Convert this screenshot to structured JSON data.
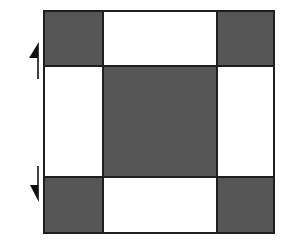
{
  "diagram": {
    "colors": {
      "background": "#ffffff",
      "shaded": "#555555",
      "unshaded": "#ffffff",
      "stroke": "#1e1e1e",
      "arrow": "#111111"
    },
    "grid": {
      "x": [
        44,
        103,
        217,
        274
      ],
      "y": [
        11,
        66,
        177,
        233
      ],
      "cells": [
        {
          "row": 0,
          "col": 0,
          "shaded": true,
          "name": "top-left-corner-square"
        },
        {
          "row": 0,
          "col": 1,
          "shaded": false,
          "name": "top-edge-rectangle"
        },
        {
          "row": 0,
          "col": 2,
          "shaded": true,
          "name": "top-right-corner-square"
        },
        {
          "row": 1,
          "col": 0,
          "shaded": false,
          "name": "left-edge-rectangle"
        },
        {
          "row": 1,
          "col": 1,
          "shaded": true,
          "name": "center-square"
        },
        {
          "row": 1,
          "col": 2,
          "shaded": false,
          "name": "right-edge-rectangle"
        },
        {
          "row": 2,
          "col": 0,
          "shaded": true,
          "name": "bottom-left-corner-square"
        },
        {
          "row": 2,
          "col": 1,
          "shaded": false,
          "name": "bottom-edge-rectangle"
        },
        {
          "row": 2,
          "col": 2,
          "shaded": true,
          "name": "bottom-right-corner-square"
        }
      ]
    },
    "arrows": [
      {
        "name": "up-arrow-icon",
        "direction": "up",
        "x": 38,
        "tail_y": 79,
        "tip_y": 42,
        "head_len": 16,
        "head_width": 9
      },
      {
        "name": "down-arrow-icon",
        "direction": "down",
        "x": 38,
        "tail_y": 166,
        "tip_y": 202,
        "head_len": 17,
        "head_width": 8
      }
    ]
  }
}
